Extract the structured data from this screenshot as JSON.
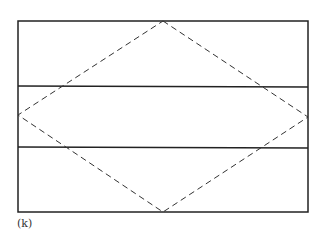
{
  "figure": {
    "caption": "(k)",
    "rectangle": {
      "x1": 18,
      "y1": 21,
      "x2": 308,
      "y2": 212
    },
    "horizontal_lines": [
      86,
      148
    ],
    "diamond": {
      "top": [
        163,
        21
      ],
      "right": [
        308,
        117
      ],
      "bottom": [
        163,
        212
      ],
      "left": [
        18,
        115
      ]
    },
    "colors": {
      "solid_line": "#222222",
      "dashed_line": "#333333",
      "background": "#ffffff"
    }
  }
}
